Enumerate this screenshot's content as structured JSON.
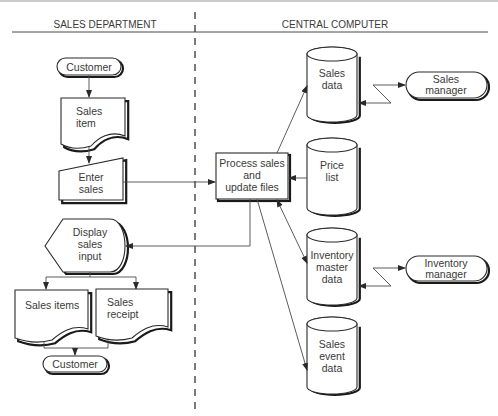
{
  "diagram": {
    "type": "system flowchart",
    "lanes": {
      "left": "SALES DEPARTMENT",
      "right": "CENTRAL COMPUTER"
    },
    "nodes": {
      "customer_top": {
        "shape": "terminator",
        "label": "Customer"
      },
      "sales_item": {
        "shape": "document",
        "lines": [
          "Sales",
          "item"
        ]
      },
      "enter_sales": {
        "shape": "manual-input",
        "lines": [
          "Enter",
          "sales"
        ]
      },
      "process": {
        "shape": "process",
        "lines": [
          "Process sales",
          "and",
          "update files"
        ]
      },
      "display": {
        "shape": "display",
        "lines": [
          "Display",
          "sales",
          "input"
        ]
      },
      "sales_items_doc": {
        "shape": "document",
        "lines": [
          "Sales items"
        ]
      },
      "sales_receipt": {
        "shape": "document",
        "lines": [
          "Sales",
          "receipt"
        ]
      },
      "customer_bottom": {
        "shape": "terminator",
        "label": "Customer"
      },
      "sales_data": {
        "shape": "disk-storage",
        "lines": [
          "Sales",
          "data"
        ]
      },
      "price_list": {
        "shape": "disk-storage",
        "lines": [
          "Price",
          "list"
        ]
      },
      "inventory_master": {
        "shape": "disk-storage",
        "lines": [
          "Inventory",
          "master",
          "data"
        ]
      },
      "sales_event": {
        "shape": "disk-storage",
        "lines": [
          "Sales",
          "event",
          "data"
        ]
      },
      "sales_manager": {
        "shape": "terminator",
        "lines": [
          "Sales",
          "manager"
        ]
      },
      "inventory_manager": {
        "shape": "terminator",
        "lines": [
          "Inventory",
          "manager"
        ]
      }
    },
    "edges": [
      {
        "from": "Customer",
        "to": "Sales item"
      },
      {
        "from": "Sales item",
        "to": "Enter sales"
      },
      {
        "from": "Enter sales",
        "to": "Process sales and update files"
      },
      {
        "from": "Process sales and update files",
        "to": "Sales data"
      },
      {
        "from": "Price list",
        "to": "Process sales and update files"
      },
      {
        "from": "Process sales and update files",
        "to": "Inventory master data",
        "bidirectional": true
      },
      {
        "from": "Process sales and update files",
        "to": "Sales event data"
      },
      {
        "from": "Process sales and update files",
        "to": "Display sales input"
      },
      {
        "from": "Display sales input",
        "to": "Sales items"
      },
      {
        "from": "Display sales input",
        "to": "Sales receipt"
      },
      {
        "from": "Sales items",
        "to": "Customer"
      },
      {
        "from": "Sales receipt",
        "to": "Customer"
      },
      {
        "from": "Sales data",
        "to": "Sales manager",
        "type": "communication link",
        "bidirectional": true
      },
      {
        "from": "Inventory master data",
        "to": "Inventory manager",
        "type": "communication link",
        "bidirectional": true
      }
    ]
  }
}
